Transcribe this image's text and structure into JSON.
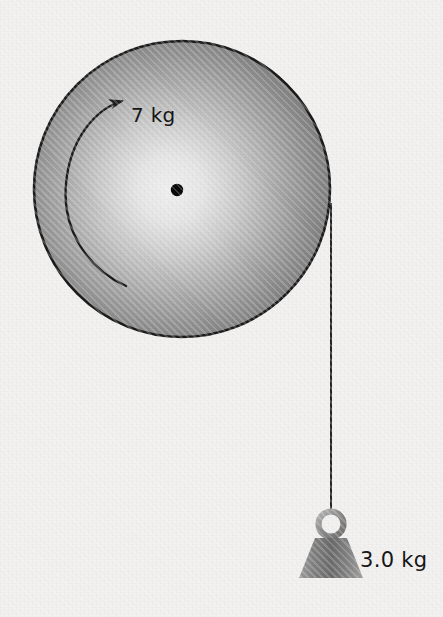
{
  "diagram": {
    "background_color": "#f1f0ef",
    "canvas": {
      "width": 443,
      "height": 617
    }
  },
  "disk": {
    "label": "7 kg",
    "name": "rotating-disk",
    "center": {
      "x": 182,
      "y": 189
    },
    "radius": 148,
    "outline_color": "#1a1a1a",
    "fill_center_color": "#ececec",
    "fill_edge_color": "#6a6a6a",
    "axle": {
      "label": "",
      "center": {
        "x": 177,
        "y": 190
      },
      "radius": 6,
      "color": "#080808"
    },
    "rotation_arrow": {
      "direction": "counterclockwise",
      "color": "#1a1a1a"
    }
  },
  "string": {
    "name": "string",
    "color": "#1a1a1a",
    "x": 331,
    "top_y": 205,
    "bottom_y": 512
  },
  "hanging_weight": {
    "label": "3.0 kg",
    "name": "hanging-weight",
    "ring": {
      "center": {
        "x": 331,
        "y": 524
      },
      "outer_radius": 15,
      "inner_radius": 9
    },
    "body": {
      "top_y": 536,
      "bottom_y": 578,
      "top_half_width": 16,
      "bottom_half_width": 32
    },
    "fill_light_color": "#a8a8a8",
    "fill_dark_color": "#5e5e5e"
  },
  "labels": {
    "disk_mass": "7 kg",
    "weight_mass": "3.0 kg"
  }
}
